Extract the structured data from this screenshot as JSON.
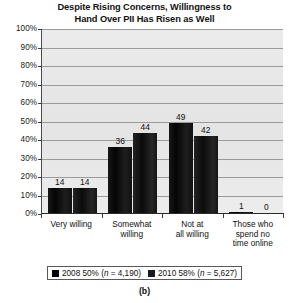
{
  "chart_data": {
    "type": "bar",
    "title": "Despite Rising Concerns, Willingness to Hand Over PII Has Risen as Well",
    "title_line1": "Despite Rising Concerns, Willingness to",
    "title_line2": "Hand Over PII Has Risen as Well",
    "xlabel": "",
    "ylabel": "",
    "ylim": [
      0,
      100
    ],
    "ytick_labels": [
      "100%",
      "90%",
      "80%",
      "70%",
      "60%",
      "50%",
      "40%",
      "30%",
      "20%",
      "10%",
      "0%"
    ],
    "ytick_values": [
      100,
      90,
      80,
      70,
      60,
      50,
      40,
      30,
      20,
      10,
      0
    ],
    "grid": true,
    "legend_position": "bottom",
    "categories": [
      "Very willing",
      "Somewhat willing",
      "Not at all willing",
      "Those who spend no time online"
    ],
    "category_lines": [
      [
        "Very willing"
      ],
      [
        "Somewhat",
        "willing"
      ],
      [
        "Not at",
        "all willing"
      ],
      [
        "Those who",
        "spend no",
        "time online"
      ]
    ],
    "series": [
      {
        "name": "2008 50% (n = 4,190)",
        "year": "2008",
        "percent": "50%",
        "n": "4,190",
        "color": "#060606",
        "values": [
          14,
          36,
          49,
          1
        ]
      },
      {
        "name": "2010 58% (n = 5,627)",
        "year": "2010",
        "percent": "58%",
        "n": "5,627",
        "color": "#1a1a1a",
        "values": [
          14,
          44,
          42,
          0
        ]
      }
    ]
  },
  "legend": {
    "entries": [
      {
        "prefix": "2008 50% (",
        "italic": "n",
        "suffix": " = 4,190)"
      },
      {
        "prefix": "2010 58% (",
        "italic": "n",
        "suffix": " = 5,627)"
      }
    ]
  },
  "caption": "(b)",
  "colors": {
    "plot_background": "#e9e9e9",
    "gridline": "#9a9a9a",
    "axis": "#2b2b2b",
    "text": "#101010",
    "series_2008": "#060606",
    "series_2010": "#1a1a1a"
  }
}
